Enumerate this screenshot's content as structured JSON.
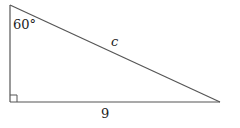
{
  "figure": {
    "type": "right-triangle",
    "angle_label": "60°",
    "hypotenuse_label": "c",
    "base_label": "9",
    "right_angle_marker": true,
    "colors": {
      "stroke": "#555555",
      "text": "#222222",
      "background": "#ffffff"
    }
  }
}
